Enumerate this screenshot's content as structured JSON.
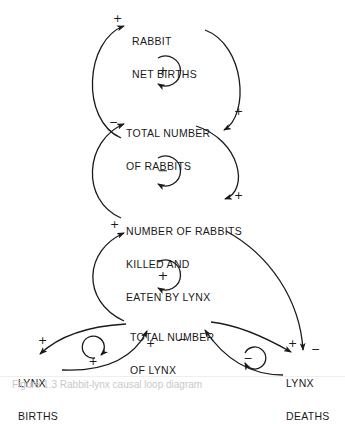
{
  "diagram": {
    "type": "causal-loop",
    "nodes": [
      {
        "id": "rabbit_net_births",
        "label_line1": "RABBIT",
        "label_line2": "NET BIRTHS"
      },
      {
        "id": "total_rabbits",
        "label_line1": "TOTAL NUMBER",
        "label_line2": "OF RABBITS"
      },
      {
        "id": "rabbits_killed",
        "label_line1": "NUMBER OF RABBITS",
        "label_line2": "KILLED AND",
        "label_line3": "EATEN BY LYNX"
      },
      {
        "id": "total_lynx",
        "label_line1": "TOTAL NUMBER",
        "label_line2": "OF LYNX"
      },
      {
        "id": "lynx_births",
        "label_line1": "LYNX",
        "label_line2": "BIRTHS"
      },
      {
        "id": "lynx_deaths",
        "label_line1": "LYNX",
        "label_line2": "DEATHS"
      }
    ],
    "links": [
      {
        "from": "total_rabbits",
        "to": "rabbit_net_births",
        "polarity": "+"
      },
      {
        "from": "rabbit_net_births",
        "to": "total_rabbits",
        "polarity": "+"
      },
      {
        "from": "total_rabbits",
        "to": "rabbits_killed",
        "polarity": "+"
      },
      {
        "from": "rabbits_killed",
        "to": "total_rabbits",
        "polarity": "−"
      },
      {
        "from": "total_lynx",
        "to": "rabbits_killed",
        "polarity": "+"
      },
      {
        "from": "rabbits_killed",
        "to": "lynx_deaths",
        "polarity": "−"
      },
      {
        "from": "total_lynx",
        "to": "lynx_births",
        "polarity": "+"
      },
      {
        "from": "lynx_births",
        "to": "total_lynx",
        "polarity": "+"
      },
      {
        "from": "total_lynx",
        "to": "lynx_deaths",
        "polarity": "+"
      },
      {
        "from": "lynx_deaths",
        "to": "total_lynx",
        "polarity": "−"
      }
    ],
    "loops": [
      {
        "id": "rabbit_births_loop",
        "polarity": "+"
      },
      {
        "id": "rabbit_predation_loop",
        "polarity": "−"
      },
      {
        "id": "lynx_predation_loop",
        "polarity": "+"
      },
      {
        "id": "lynx_births_loop",
        "polarity": "+"
      },
      {
        "id": "lynx_deaths_loop",
        "polarity": "−"
      }
    ],
    "signs": {
      "top_left_plus": "+",
      "top_right_plus": "+",
      "mid_left_minus": "−",
      "mid_right_plus": "+",
      "lower_left_plus": "+",
      "births_out_plus": "+",
      "births_in_plus": "+",
      "deaths_in_minus": "−",
      "deaths_left_plus": "+",
      "deaths_right_minus": "−"
    }
  },
  "caption": "Figure 1.3  Rabbit-lynx causal loop diagram"
}
